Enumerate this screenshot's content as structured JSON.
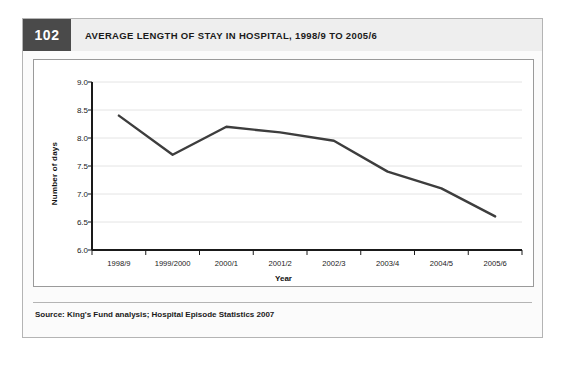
{
  "figure": {
    "number": "102",
    "title": "AVERAGE LENGTH OF STAY IN HOSPITAL, 1998/9 TO 2005/6",
    "source": "Source: King's Fund analysis; Hospital Episode Statistics 2007"
  },
  "colors": {
    "line": "#3d3d3d",
    "grid": "#e4e4e4",
    "axis": "#1a1a1a",
    "badge_bg": "#4a4a4a",
    "header_bg": "#eeeeee",
    "frame_border": "#9a9a9a"
  },
  "chart_data": {
    "type": "line",
    "title": "AVERAGE LENGTH OF STAY IN HOSPITAL, 1998/9 TO 2005/6",
    "xlabel": "Year",
    "ylabel": "Number of days",
    "categories": [
      "1998/9",
      "1999/2000",
      "2000/1",
      "2001/2",
      "2002/3",
      "2003/4",
      "2004/5",
      "2005/6"
    ],
    "values": [
      8.4,
      7.7,
      8.2,
      8.1,
      7.95,
      7.4,
      7.1,
      6.6
    ],
    "ylim": [
      6.0,
      9.0
    ],
    "yticks": [
      "9.0",
      "8.5",
      "8.0",
      "7.5",
      "7.0",
      "6.5",
      "6.0"
    ],
    "ytick_values": [
      9.0,
      8.5,
      8.0,
      7.5,
      7.0,
      6.5,
      6.0
    ],
    "grid": true,
    "legend": "none",
    "series": [
      {
        "name": "Average length of stay",
        "values": [
          8.4,
          7.7,
          8.2,
          8.1,
          7.95,
          7.4,
          7.1,
          6.6
        ]
      }
    ]
  }
}
